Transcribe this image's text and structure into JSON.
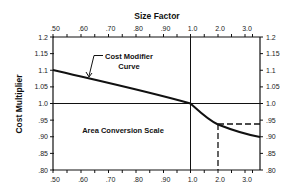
{
  "chart_data": {
    "type": "line",
    "title": "Size Factor",
    "xlabel": "Size Factor",
    "ylabel": "Cost Multiplier",
    "x_ticks_top": [
      ".50",
      ".60",
      ".70",
      ".80",
      ".90",
      "1.0",
      "2.0",
      "3.0"
    ],
    "x_ticks_bottom": [
      ".50",
      ".60",
      ".70",
      ".80",
      ".90",
      "1.0",
      "2.0",
      "3.0"
    ],
    "y_ticks_left": [
      "1.2",
      "1.15",
      "1.1",
      "1.05",
      "1.0",
      ".95",
      ".90",
      ".85",
      ".80"
    ],
    "y_ticks_right": [
      "1.2",
      "1.15",
      "1.1",
      "1.05",
      "1.0",
      ".95",
      ".90",
      ".85",
      ".80"
    ],
    "ylim": [
      0.8,
      1.2
    ],
    "xlim": [
      0.5,
      3.5
    ],
    "grid": false,
    "series": [
      {
        "name": "Cost Modifier Curve",
        "x": [
          0.5,
          0.6,
          0.7,
          0.8,
          0.9,
          1.0,
          1.5,
          2.0,
          2.5,
          3.0,
          3.5
        ],
        "y": [
          1.1,
          1.08,
          1.06,
          1.04,
          1.02,
          1.0,
          0.965,
          0.94,
          0.92,
          0.908,
          0.9
        ]
      }
    ],
    "reference_lines": [
      {
        "type": "horizontal",
        "y": 1.0,
        "style": "solid"
      },
      {
        "type": "vertical",
        "x": 1.0,
        "style": "solid"
      },
      {
        "type": "vertical",
        "x": 2.0,
        "y_from": 0.8,
        "y_to": 0.94,
        "style": "dashed"
      },
      {
        "type": "horizontal",
        "y": 0.94,
        "x_from": 2.0,
        "x_to": 3.5,
        "style": "dashed"
      }
    ],
    "annotations": [
      {
        "text": "Cost Modifier Curve",
        "arrow_to": {
          "x": 0.62,
          "y": 1.075
        }
      },
      {
        "text": "Area Conversion Scale"
      }
    ]
  },
  "labels": {
    "top_title": "Size Factor",
    "y_axis_title": "Cost Multiplier",
    "curve_label_line1": "Cost Modifier",
    "curve_label_line2": "Curve",
    "scale_label": "Area Conversion Scale"
  }
}
